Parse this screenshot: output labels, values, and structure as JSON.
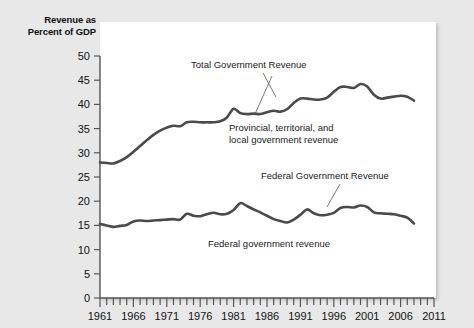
{
  "chart_data": {
    "type": "line",
    "title": "",
    "ylabel": "Revenue as Percent of GDP",
    "xlabel": "",
    "xlim": [
      1961,
      2011
    ],
    "ylim": [
      0,
      50
    ],
    "grid": false,
    "legend_position": "inline-annotations",
    "ytick_labels": [
      "0",
      "5",
      "10",
      "15",
      "20",
      "25",
      "30",
      "35",
      "40",
      "45",
      "50"
    ],
    "ytick_values": [
      0,
      5,
      10,
      15,
      20,
      25,
      30,
      35,
      40,
      45,
      50
    ],
    "xtick_labels": [
      "1961",
      "1966",
      "1971",
      "1976",
      "1981",
      "1986",
      "1991",
      "1996",
      "2001",
      "2006",
      "2011"
    ],
    "xtick_values": [
      1961,
      1966,
      1971,
      1976,
      1981,
      1986,
      1991,
      1996,
      2001,
      2006,
      2011
    ],
    "minor_tick_interval": 1,
    "x": [
      1961,
      1962,
      1963,
      1964,
      1965,
      1966,
      1967,
      1968,
      1969,
      1970,
      1971,
      1972,
      1973,
      1974,
      1975,
      1976,
      1977,
      1978,
      1979,
      1980,
      1981,
      1982,
      1983,
      1984,
      1985,
      1986,
      1987,
      1988,
      1989,
      1990,
      1991,
      1992,
      1993,
      1994,
      1995,
      1996,
      1997,
      1998,
      1999,
      2000,
      2001,
      2002,
      2003,
      2004,
      2005,
      2006,
      2007,
      2008
    ],
    "series": [
      {
        "name": "Total Government Revenue",
        "values": [
          28.0,
          27.9,
          27.8,
          28.3,
          29.1,
          30.2,
          31.4,
          32.6,
          33.7,
          34.6,
          35.2,
          35.6,
          35.5,
          36.3,
          36.4,
          36.3,
          36.3,
          36.3,
          36.5,
          37.3,
          39.1,
          38.2,
          38.0,
          38.1,
          38.0,
          38.4,
          38.7,
          38.5,
          39.0,
          40.3,
          41.2,
          41.2,
          41.0,
          41.0,
          41.4,
          42.6,
          43.6,
          43.6,
          43.4,
          44.2,
          43.7,
          42.0,
          41.2,
          41.4,
          41.6,
          41.8,
          41.6,
          40.8
        ]
      },
      {
        "name": "Federal government revenue",
        "values": [
          15.3,
          15.0,
          14.7,
          14.9,
          15.1,
          15.8,
          16.0,
          15.9,
          16.0,
          16.1,
          16.2,
          16.3,
          16.2,
          17.4,
          17.0,
          16.9,
          17.3,
          17.6,
          17.3,
          17.4,
          18.2,
          19.6,
          19.0,
          18.3,
          17.7,
          17.0,
          16.3,
          15.9,
          15.6,
          16.2,
          17.2,
          18.3,
          17.5,
          17.1,
          17.2,
          17.6,
          18.6,
          18.8,
          18.7,
          19.1,
          18.8,
          17.7,
          17.5,
          17.4,
          17.3,
          17.0,
          16.6,
          15.4
        ]
      }
    ],
    "annotations": [
      {
        "text": "Total Government Revenue",
        "x_px": 191,
        "y_px": 68
      },
      {
        "text": "Provincial, territorial, and",
        "x_px": 229,
        "y_px": 131
      },
      {
        "text": "local government revenue",
        "x_px": 229,
        "y_px": 143
      },
      {
        "text": "Federal Government Revenue",
        "x_px": 261,
        "y_px": 179
      },
      {
        "text": "Federal government revenue",
        "x_px": 208,
        "y_px": 247
      }
    ]
  },
  "colors": {
    "background": "#e8e8e8",
    "panel": "#ffffff",
    "line": "#4a4a4a",
    "axis": "#555555",
    "text": "#111111"
  }
}
